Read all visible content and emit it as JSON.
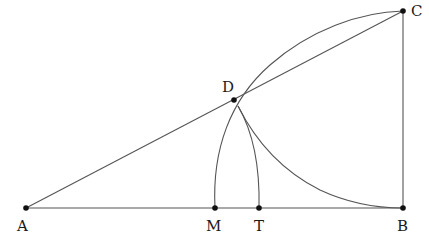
{
  "diagram": {
    "type": "geometric-construction",
    "points": [
      {
        "id": "A",
        "label": "A",
        "x": 26,
        "y": 208,
        "lx": 17,
        "ly": 219
      },
      {
        "id": "M",
        "label": "M",
        "x": 215,
        "y": 208,
        "lx": 206,
        "ly": 219
      },
      {
        "id": "T",
        "label": "T",
        "x": 259,
        "y": 208,
        "lx": 254,
        "ly": 219
      },
      {
        "id": "B",
        "label": "B",
        "x": 403,
        "y": 208,
        "lx": 397,
        "ly": 219
      },
      {
        "id": "C",
        "label": "C",
        "x": 403,
        "y": 11,
        "lx": 411,
        "ly": 9
      },
      {
        "id": "D",
        "label": "D",
        "x": 234,
        "y": 100,
        "lx": 222,
        "ly": 82
      }
    ],
    "segments": [
      {
        "from": "A",
        "to": "B"
      },
      {
        "from": "A",
        "to": "C"
      },
      {
        "from": "B",
        "to": "C"
      }
    ],
    "arcs": [
      {
        "name": "arc-M-to-C",
        "description": "Arc from M up to C"
      },
      {
        "name": "arc-T-to-D",
        "description": "Arc from T up to D"
      },
      {
        "name": "arc-D-to-B",
        "description": "Arc from D down to B"
      }
    ],
    "stroke_color": "#555555",
    "point_color": "#111111"
  }
}
